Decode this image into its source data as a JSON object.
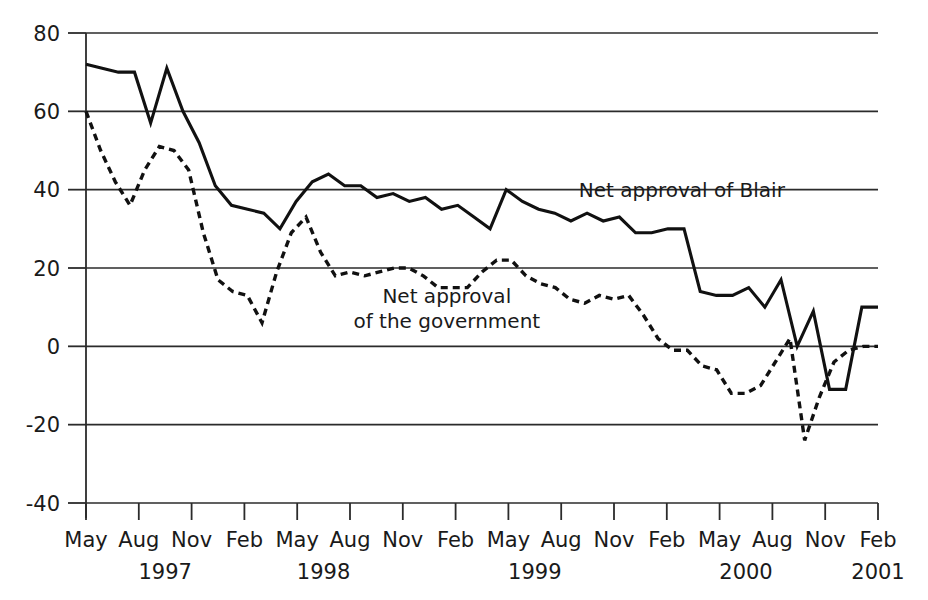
{
  "chart_data": {
    "type": "line",
    "title": "",
    "subtitle": "",
    "xlabel": "",
    "ylabel": "",
    "ylim": [
      -40,
      80
    ],
    "yticks": [
      -40,
      -20,
      0,
      20,
      40,
      60,
      80
    ],
    "ytick_labels": [
      "-40",
      "-20",
      "0",
      "20",
      "40",
      "60",
      "80"
    ],
    "grid": true,
    "grid_axis": "y",
    "legend_position": "inline-annotation",
    "x_axis_type": "monthly",
    "x_start": "1997-05",
    "x_end": "2001-02",
    "xticks": [
      {
        "month": "May",
        "index": 0
      },
      {
        "month": "Aug",
        "index": 3
      },
      {
        "month": "Nov",
        "index": 6
      },
      {
        "month": "Feb",
        "index": 9
      },
      {
        "month": "May",
        "index": 12
      },
      {
        "month": "Aug",
        "index": 15
      },
      {
        "month": "Nov",
        "index": 18
      },
      {
        "month": "Feb",
        "index": 21
      },
      {
        "month": "May",
        "index": 24
      },
      {
        "month": "Aug",
        "index": 27
      },
      {
        "month": "Nov",
        "index": 30
      },
      {
        "month": "Feb",
        "index": 33
      },
      {
        "month": "May",
        "index": 36
      },
      {
        "month": "Aug",
        "index": 39
      },
      {
        "month": "Nov",
        "index": 42
      },
      {
        "month": "Feb",
        "index": 45
      }
    ],
    "year_labels": [
      {
        "label": "1997",
        "index": 4.5
      },
      {
        "label": "1998",
        "index": 13.5
      },
      {
        "label": "1999",
        "index": 25.5
      },
      {
        "label": "2000",
        "index": 37.5
      },
      {
        "label": "2001",
        "index": 45
      }
    ],
    "series": [
      {
        "name": "Net approval of Blair",
        "style": "solid",
        "annotation": "Net approval of Blair",
        "annotation_index": 28.0,
        "annotation_value": 40.0,
        "points": [
          {
            "index": 0,
            "value": 72
          },
          {
            "index": 1,
            "value": 71
          },
          {
            "index": 2,
            "value": 70
          },
          {
            "index": 3,
            "value": 70
          },
          {
            "index": 4,
            "value": 57
          },
          {
            "index": 5,
            "value": 71
          },
          {
            "index": 6,
            "value": 60
          },
          {
            "index": 7,
            "value": 52
          },
          {
            "index": 8,
            "value": 41
          },
          {
            "index": 9,
            "value": 36
          },
          {
            "index": 10,
            "value": 35
          },
          {
            "index": 11,
            "value": 34
          },
          {
            "index": 12,
            "value": 30
          },
          {
            "index": 13,
            "value": 37
          },
          {
            "index": 14,
            "value": 42
          },
          {
            "index": 15,
            "value": 44
          },
          {
            "index": 16,
            "value": 41
          },
          {
            "index": 17,
            "value": 41
          },
          {
            "index": 18,
            "value": 38
          },
          {
            "index": 19,
            "value": 39
          },
          {
            "index": 20,
            "value": 37
          },
          {
            "index": 21,
            "value": 38
          },
          {
            "index": 22,
            "value": 35
          },
          {
            "index": 23,
            "value": 36
          },
          {
            "index": 24,
            "value": 33
          },
          {
            "index": 25,
            "value": 30
          },
          {
            "index": 26,
            "value": 40
          },
          {
            "index": 27,
            "value": 37
          },
          {
            "index": 28,
            "value": 35
          },
          {
            "index": 29,
            "value": 34
          },
          {
            "index": 30,
            "value": 32
          },
          {
            "index": 31,
            "value": 34
          },
          {
            "index": 32,
            "value": 32
          },
          {
            "index": 33,
            "value": 33
          },
          {
            "index": 34,
            "value": 29
          },
          {
            "index": 35,
            "value": 29
          },
          {
            "index": 36,
            "value": 30
          },
          {
            "index": 37,
            "value": 30
          },
          {
            "index": 38,
            "value": 14
          },
          {
            "index": 39,
            "value": 13
          },
          {
            "index": 40,
            "value": 13
          },
          {
            "index": 41,
            "value": 15
          },
          {
            "index": 42,
            "value": 10
          },
          {
            "index": 43,
            "value": 17
          },
          {
            "index": 44,
            "value": 0
          },
          {
            "index": 45,
            "value": 9
          },
          {
            "index": 46,
            "value": -11
          },
          {
            "index": 47,
            "value": -11
          },
          {
            "index": 48,
            "value": 10
          },
          {
            "index": 49,
            "value": 10
          }
        ]
      },
      {
        "name": "Net approval of the government",
        "style": "dashed",
        "annotation_line1": "Net approval",
        "annotation_line2": "of the government",
        "annotation_index": 20.5,
        "annotation_value": 11.0,
        "points": [
          {
            "index": 0,
            "value": 60
          },
          {
            "index": 1,
            "value": 50
          },
          {
            "index": 2,
            "value": 42
          },
          {
            "index": 3,
            "value": 36
          },
          {
            "index": 4,
            "value": 45
          },
          {
            "index": 5,
            "value": 51
          },
          {
            "index": 6,
            "value": 50
          },
          {
            "index": 7,
            "value": 45
          },
          {
            "index": 8,
            "value": 29
          },
          {
            "index": 9,
            "value": 17
          },
          {
            "index": 10,
            "value": 14
          },
          {
            "index": 11,
            "value": 13
          },
          {
            "index": 12,
            "value": 6
          },
          {
            "index": 13,
            "value": 19
          },
          {
            "index": 14,
            "value": 29
          },
          {
            "index": 15,
            "value": 33
          },
          {
            "index": 16,
            "value": 24
          },
          {
            "index": 17,
            "value": 18
          },
          {
            "index": 18,
            "value": 19
          },
          {
            "index": 19,
            "value": 18
          },
          {
            "index": 20,
            "value": 19
          },
          {
            "index": 21,
            "value": 20
          },
          {
            "index": 22,
            "value": 20
          },
          {
            "index": 23,
            "value": 18
          },
          {
            "index": 24,
            "value": 15
          },
          {
            "index": 25,
            "value": 15
          },
          {
            "index": 26,
            "value": 15
          },
          {
            "index": 27,
            "value": 19
          },
          {
            "index": 28,
            "value": 22
          },
          {
            "index": 29,
            "value": 22
          },
          {
            "index": 30,
            "value": 18
          },
          {
            "index": 31,
            "value": 16
          },
          {
            "index": 32,
            "value": 15
          },
          {
            "index": 33,
            "value": 12
          },
          {
            "index": 34,
            "value": 11
          },
          {
            "index": 35,
            "value": 13
          },
          {
            "index": 36,
            "value": 12
          },
          {
            "index": 37,
            "value": 13
          },
          {
            "index": 38,
            "value": 8
          },
          {
            "index": 39,
            "value": 2
          },
          {
            "index": 40,
            "value": -1
          },
          {
            "index": 41,
            "value": -1
          },
          {
            "index": 42,
            "value": -5
          },
          {
            "index": 43,
            "value": -6
          },
          {
            "index": 44,
            "value": -12
          },
          {
            "index": 45,
            "value": -12
          },
          {
            "index": 46,
            "value": -10
          },
          {
            "index": 47,
            "value": -4
          },
          {
            "index": 48,
            "value": 2
          },
          {
            "index": 49,
            "value": -24
          },
          {
            "index": 50,
            "value": -13
          },
          {
            "index": 51,
            "value": -4
          },
          {
            "index": 52,
            "value": -1
          },
          {
            "index": 53,
            "value": 0
          },
          {
            "index": 54,
            "value": 0
          }
        ]
      }
    ]
  }
}
